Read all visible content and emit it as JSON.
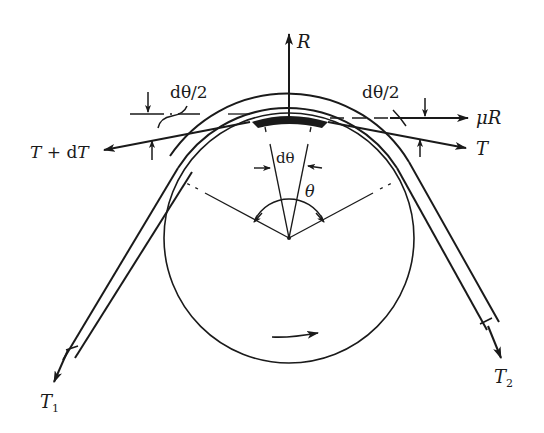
{
  "diagram": {
    "type": "belt-friction free-body diagram (capstan)",
    "colors": {
      "ink": "#1a1a1a",
      "background": "#ffffff"
    },
    "labels": {
      "normal_force": "R",
      "friction_force": "μR",
      "tension_left_top": "T + dT",
      "tension_right_top": "T",
      "half_angle_left": "dθ/2",
      "half_angle_right": "dθ/2",
      "element_angle": "dθ",
      "wrap_angle": "θ",
      "tension_slack_end": "T",
      "tension_slack_sub": "1",
      "tension_tight_end": "T",
      "tension_tight_sub": "2"
    },
    "elements": {
      "pulley": {
        "shape": "circle",
        "center": [
          289,
          238
        ],
        "radius": 125
      },
      "belt": {
        "wraps": "over top of pulley, exits tangentially to lower-left and lower-right"
      },
      "belt_element": {
        "shape": "shaded arc segment at top of pulley"
      },
      "rotation_arrow": {
        "direction": "clockwise (arrow pointing right at bottom)"
      }
    }
  }
}
